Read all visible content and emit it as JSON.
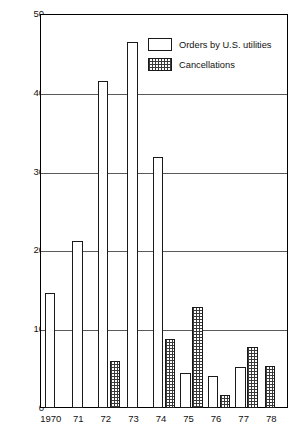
{
  "chart_data": {
    "type": "bar",
    "title": "",
    "subtitle": "",
    "xlabel": "",
    "ylabel": "Thousands of megawatts of net generating capacity",
    "categories": [
      "1970",
      "71",
      "72",
      "73",
      "74",
      "75",
      "76",
      "77",
      "78"
    ],
    "ylim": [
      0,
      50
    ],
    "yticks": [
      0,
      10,
      20,
      30,
      40,
      50
    ],
    "ytick_labels": [
      "0",
      "10",
      "20",
      "30",
      "40",
      "50"
    ],
    "grid": "horizontal",
    "legend_position": "top-right",
    "series": [
      {
        "name": "Orders by U.S. utilities",
        "fill": "white",
        "values": [
          14.6,
          21.2,
          41.5,
          46.5,
          31.8,
          4.4,
          4.0,
          5.2,
          0
        ]
      },
      {
        "name": "Cancellations",
        "fill": "stippled",
        "values": [
          0,
          0,
          6.0,
          0,
          8.7,
          12.8,
          1.7,
          7.8,
          5.3
        ]
      }
    ]
  },
  "legend": {
    "items": [
      {
        "label": "Orders by U.S. utilities",
        "swatch": "white-box-icon"
      },
      {
        "label": "Cancellations",
        "swatch": "stippled-box-icon"
      }
    ]
  }
}
